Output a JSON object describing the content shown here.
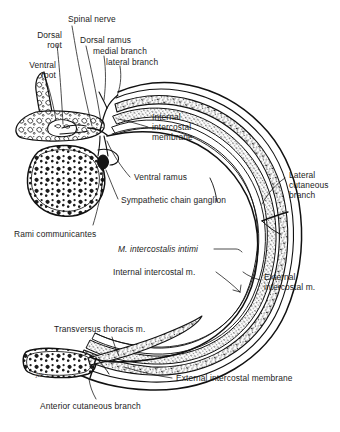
{
  "figure": {
    "artist_signature": "jcb",
    "ink_color": "#111111",
    "background_color": "#ffffff",
    "muscle_fill": "#9a9a9a",
    "bone_fill": "#ffffff"
  },
  "labels": {
    "dorsal_root": "Dorsal\nroot",
    "ventral_root": "Ventral\nroot",
    "spinal_nerve": "Spinal nerve",
    "dorsal_ramus": "Dorsal ramus",
    "medial_branch": "medial branch",
    "lateral_branch": "lateral branch",
    "internal_intercostal_membrane": "Internal\nintercostal\nmembrane",
    "ventral_ramus": "Ventral ramus",
    "sympathetic_chain_ganglion": "Sympathetic chain ganglion",
    "rami_communicantes": "Rami communicantes",
    "lateral_cutaneous_branch": "Lateral\ncutaneous\nbranch",
    "m_intercostalis_intimi": "M. intercostalis intimi",
    "internal_intercostal_m": "Internal intercostal m.",
    "external_intercostal_m": "External\nintercostal m.",
    "transversus_thoracis_m": "Transversus thoracis m.",
    "external_intercostal_membrane": "External intercostal membrane",
    "anterior_cutaneous_branch": "Anterior cutaneous branch"
  },
  "structures": [
    {
      "name": "vertebra",
      "description": "vertebral arch with spinous process, left upper"
    },
    {
      "name": "vertebral-body",
      "description": "trabecular vertebral body, left middle"
    },
    {
      "name": "rib-wall-arc",
      "description": "curved thoracic wall with layered intercostal muscles"
    },
    {
      "name": "sternum",
      "description": "sternum cross-section, bottom left"
    },
    {
      "name": "intercostal-nerve",
      "description": "nerve running in neurovascular plane around arc"
    }
  ]
}
